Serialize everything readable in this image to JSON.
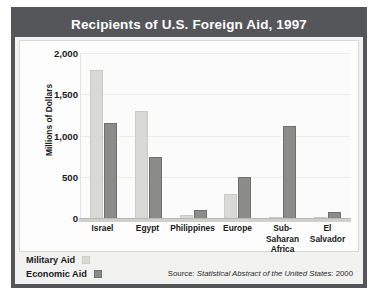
{
  "figure": {
    "title": "Recipients of U.S. Foreign Aid, 1997",
    "source_prefix": "Source:",
    "source_italic": "Statistical Abstract of the United States",
    "source_suffix": ": 2000"
  },
  "legend": {
    "military_label": "Military Aid",
    "economic_label": "Economic Aid"
  },
  "colors": {
    "frame": "#55565a",
    "title_bar": "#55565a",
    "title_text": "#ffffff",
    "military_bar": "#d9d9d6",
    "economic_bar": "#8b8b89",
    "plot_background": "#fbfbfb",
    "card_background": "#f2f2f0",
    "gridline": "#ececea"
  },
  "chart_data": {
    "type": "bar",
    "title": "Recipients of U.S. Foreign Aid, 1997",
    "xlabel": "",
    "ylabel": "Millions of Dollars",
    "ylim": [
      0,
      2000
    ],
    "yticks": [
      0,
      500,
      1000,
      1500,
      2000
    ],
    "ytick_labels": [
      "0",
      "500",
      "1,000",
      "1,500",
      "2,000"
    ],
    "grid": true,
    "legend_position": "below-left",
    "categories": [
      "Israel",
      "Egypt",
      "Philippines",
      "Europe",
      "Sub-Saharan Africa",
      "El Salvador"
    ],
    "category_lines": [
      [
        "Israel"
      ],
      [
        "Egypt"
      ],
      [
        "Philippines"
      ],
      [
        "Europe"
      ],
      [
        "Sub-Saharan",
        "Africa"
      ],
      [
        "El",
        "Salvador"
      ]
    ],
    "series": [
      {
        "name": "Military Aid",
        "color": "#d9d9d6",
        "values": [
          1800,
          1300,
          40,
          290,
          15,
          10
        ]
      },
      {
        "name": "Economic Aid",
        "color": "#8b8b89",
        "values": [
          1150,
          740,
          100,
          500,
          1120,
          75
        ]
      }
    ],
    "annotations": [
      "Source: Statistical Abstract of the United States: 2000"
    ]
  }
}
